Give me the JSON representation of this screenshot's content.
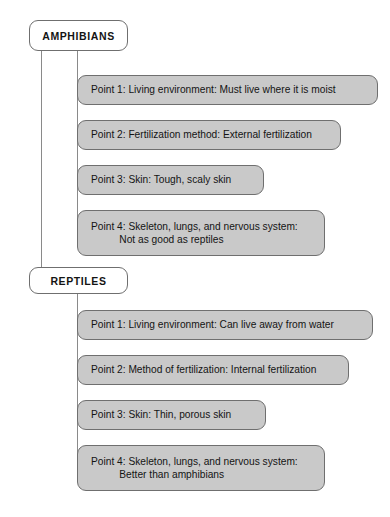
{
  "diagram": {
    "type": "comparison-tree",
    "colors": {
      "box_fill": "#c9c9c9",
      "header_fill": "#ffffff",
      "border": "#6f6f6f",
      "line": "#8a8a8a",
      "text": "#141414",
      "background": "#ffffff"
    },
    "sections": [
      {
        "id": "amphibians",
        "header": "AMPHIBIANS",
        "points": [
          {
            "id": "amphibians-point-1",
            "label": "Point 1: Living environment: Must live where it is moist",
            "lines": [
              "Point 1: Living environment: Must live where it is moist"
            ]
          },
          {
            "id": "amphibians-point-2",
            "label": "Point 2: Fertilization method: External fertilization",
            "lines": [
              "Point 2: Fertilization method: External fertilization"
            ]
          },
          {
            "id": "amphibians-point-3",
            "label": "Point 3: Skin: Tough, scaly skin",
            "lines": [
              "Point 3: Skin: Tough, scaly skin"
            ]
          },
          {
            "id": "amphibians-point-4",
            "label": "Point 4: Skeleton, lungs, and nervous system: Not as good as reptiles",
            "lines": [
              "Point 4: Skeleton, lungs, and nervous system:",
              "          Not as good as reptiles"
            ]
          }
        ]
      },
      {
        "id": "reptiles",
        "header": "REPTILES",
        "points": [
          {
            "id": "reptiles-point-1",
            "label": "Point 1: Living environment: Can live away from water",
            "lines": [
              "Point 1: Living environment: Can live away from water"
            ]
          },
          {
            "id": "reptiles-point-2",
            "label": "Point 2: Method of fertilization: Internal fertilization",
            "lines": [
              "Point 2: Method of fertilization: Internal fertilization"
            ]
          },
          {
            "id": "reptiles-point-3",
            "label": "Point 3: Skin: Thin, porous skin",
            "lines": [
              "Point 3: Skin: Thin, porous skin"
            ]
          },
          {
            "id": "reptiles-point-4",
            "label": "Point 4: Skeleton, lungs, and nervous system: Better than amphibians",
            "lines": [
              "Point 4: Skeleton, lungs, and nervous system:",
              "          Better than amphibians"
            ]
          }
        ]
      }
    ]
  }
}
